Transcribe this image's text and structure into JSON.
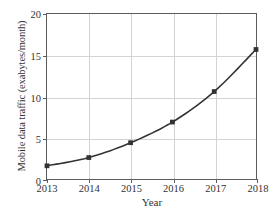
{
  "chart_data": {
    "type": "line",
    "title": "",
    "xlabel": "Year",
    "ylabel": "Mobile data traffic (exabytes/month)",
    "categories": [
      "2013",
      "2014",
      "2015",
      "2016",
      "2017",
      "2018"
    ],
    "x": [
      2013,
      2014,
      2015,
      2016,
      2017,
      2018
    ],
    "values": [
      1.6,
      2.6,
      4.4,
      6.9,
      10.6,
      15.7
    ],
    "series": [
      {
        "name": "Mobile data traffic",
        "values": [
          1.6,
          2.6,
          4.4,
          6.9,
          10.6,
          15.7
        ]
      }
    ],
    "xlim": [
      2013,
      2018
    ],
    "ylim": [
      0,
      20
    ],
    "xticks": [
      "2013",
      "2014",
      "2015",
      "2016",
      "2017",
      "2018"
    ],
    "yticks": [
      "0",
      "5",
      "10",
      "15",
      "20"
    ],
    "ytick_values": [
      0,
      5,
      10,
      15,
      20
    ],
    "grid": true,
    "legend": false,
    "legend_position": "none",
    "marker": "square",
    "line_color": "#333333",
    "marker_color": "#333333",
    "grid_color": "#d3d3d3",
    "axis_color": "#5c5c5c",
    "background_color": "#ffffff"
  }
}
